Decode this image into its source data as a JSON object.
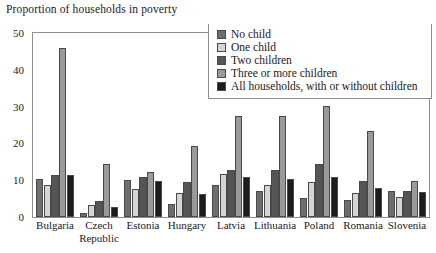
{
  "chart_data": {
    "type": "bar",
    "title": "Proportion of households in poverty",
    "xlabel": "",
    "ylabel": "",
    "ylim": [
      0,
      50
    ],
    "yticks": [
      0,
      10,
      20,
      30,
      40,
      50
    ],
    "grid": false,
    "legend_position": "top-right",
    "categories": [
      "Bulgaria",
      "Czech Republic",
      "Estonia",
      "Hungary",
      "Latvia",
      "Lithuania",
      "Poland",
      "Romania",
      "Slovenia"
    ],
    "category_lines": [
      [
        "Bulgaria",
        ""
      ],
      [
        "Czech",
        "Republic"
      ],
      [
        "Estonia",
        ""
      ],
      [
        "Hungary",
        ""
      ],
      [
        "Latvia",
        ""
      ],
      [
        "Lithuania",
        ""
      ],
      [
        "Poland",
        ""
      ],
      [
        "Romania",
        ""
      ],
      [
        "Slovenia",
        ""
      ]
    ],
    "series": [
      {
        "name": "No child",
        "color": "#6e6e6e",
        "values": [
          10.2,
          1.2,
          10.0,
          3.6,
          8.7,
          7.1,
          5.1,
          4.7,
          7.0
        ]
      },
      {
        "name": "One child",
        "color": "#d4d4d4",
        "values": [
          8.7,
          3.2,
          7.5,
          6.5,
          11.8,
          8.6,
          9.4,
          6.6,
          5.4
        ]
      },
      {
        "name": "Two children",
        "color": "#555555",
        "values": [
          11.3,
          4.4,
          10.9,
          9.6,
          12.9,
          12.7,
          14.4,
          9.8,
          7.0
        ]
      },
      {
        "name": "Three or more children",
        "color": "#9a9a9a",
        "values": [
          46.0,
          14.3,
          12.3,
          19.2,
          27.4,
          27.4,
          30.2,
          23.4,
          9.8
        ]
      },
      {
        "name": "All households, with or without children",
        "color": "#1c1c1c",
        "values": [
          11.3,
          2.7,
          9.9,
          6.2,
          11.0,
          10.2,
          11.0,
          7.9,
          6.7
        ]
      }
    ]
  },
  "axis": {
    "tick_labels": [
      "50",
      "40",
      "30",
      "20",
      "10",
      "0"
    ]
  }
}
